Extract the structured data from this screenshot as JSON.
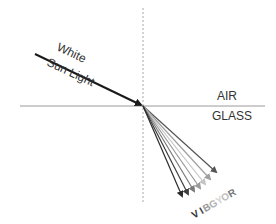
{
  "diagram": {
    "incident_label_line1": "White",
    "incident_label_line2": "Sun Light",
    "medium_top": "AIR",
    "medium_bottom": "GLASS",
    "colors": {
      "incident_ray": "#1a1a1a",
      "interface_line": "#9a9a9a",
      "normal_line": "#a8a8a8"
    },
    "rays": [
      {
        "name": "V",
        "label": "V",
        "end": [
          183,
          198
        ],
        "color": "#2b2b2b"
      },
      {
        "name": "I",
        "label": "I",
        "end": [
          189,
          196
        ],
        "color": "#3d3d3d"
      },
      {
        "name": "B",
        "label": "B",
        "end": [
          196,
          193
        ],
        "color": "#7a7a7a"
      },
      {
        "name": "G",
        "label": "G",
        "end": [
          202,
          190
        ],
        "color": "#9a9a9a"
      },
      {
        "name": "Y",
        "label": "Y",
        "end": [
          207,
          186
        ],
        "color": "#c4c4c4"
      },
      {
        "name": "O",
        "label": "O",
        "end": [
          212,
          181
        ],
        "color": "#a0a0a0"
      },
      {
        "name": "R",
        "label": "R",
        "end": [
          218,
          174
        ],
        "color": "#555555"
      }
    ],
    "spectrum_label": "VIBGYOR"
  }
}
